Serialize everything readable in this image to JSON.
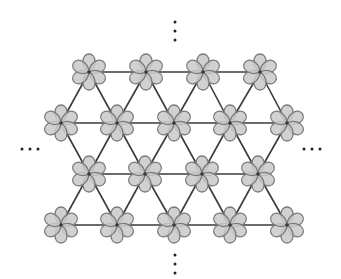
{
  "diagram": {
    "title": "",
    "colors": {
      "background": "#ffffff",
      "bond": "#3a3a3a",
      "petal_fill": "#c9c9c9",
      "petal_stroke": "#7a7a7a",
      "dot": "#222222"
    },
    "rows": [
      {
        "y": 72,
        "x": [
          89,
          146,
          203,
          260
        ]
      },
      {
        "y": 123,
        "x": [
          61,
          117,
          174,
          230,
          287
        ]
      },
      {
        "y": 174,
        "x": [
          89,
          145,
          202,
          258
        ]
      },
      {
        "y": 225,
        "x": [
          61,
          117,
          174,
          230,
          287
        ]
      }
    ],
    "motif": {
      "lobes": 6,
      "lobe_length": 18,
      "lobe_width": 10,
      "orientation_deg": 0
    },
    "ellipses": {
      "top": {
        "axis": "vertical",
        "points": [
          [
            175,
            22
          ],
          [
            175,
            31
          ],
          [
            175,
            40
          ]
        ]
      },
      "bottom": {
        "axis": "vertical",
        "points": [
          [
            175,
            255
          ],
          [
            175,
            264
          ],
          [
            175,
            273
          ]
        ]
      },
      "left": {
        "axis": "horizontal",
        "points": [
          [
            22,
            149
          ],
          [
            30,
            149
          ],
          [
            38,
            149
          ]
        ]
      },
      "right": {
        "axis": "horizontal",
        "points": [
          [
            304,
            149
          ],
          [
            312,
            149
          ],
          [
            320,
            149
          ]
        ]
      }
    }
  }
}
